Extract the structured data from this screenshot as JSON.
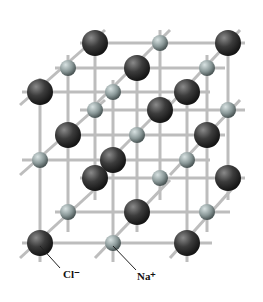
{
  "diagram": {
    "labels": {
      "chloride": "Cl⁻",
      "sodium": "Na⁺"
    },
    "colors": {
      "chloride": "#3a3a3a",
      "sodium": "#8a9a9a",
      "rod": "#c8c8c8"
    }
  }
}
